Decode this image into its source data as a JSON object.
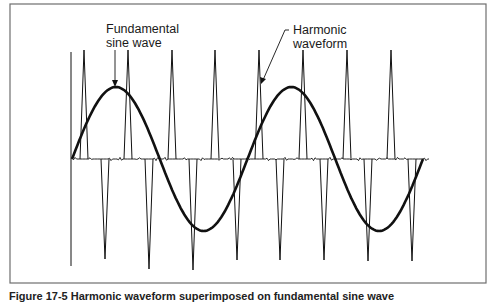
{
  "figure": {
    "labels": {
      "fundamental_line1": "Fundamental",
      "fundamental_line2": "sine wave",
      "harmonic_line1": "Harmonic",
      "harmonic_line2": "waveform"
    },
    "caption": "Figure 17-5  Harmonic waveform superimposed on fundamental sine wave"
  },
  "colors": {
    "frame": "#6e6e6e",
    "stroke": "#111111",
    "background": "#ffffff"
  },
  "geometry": {
    "frame": {
      "x": 10,
      "y": 4,
      "w": 476,
      "h": 279
    },
    "baseline": {
      "y": 159,
      "x_start": 72,
      "x_end": 430
    },
    "left_marker": {
      "x": 71,
      "y_top": 52,
      "y_bottom": 266
    },
    "up_spikes_x": [
      84,
      128,
      172,
      215,
      259,
      303,
      347,
      391
    ],
    "up_spike_top_y": 50,
    "down_spikes_x": [
      105,
      149,
      193,
      237,
      280,
      324,
      368,
      412
    ],
    "down_spike_bottom_y": [
      259,
      269,
      270,
      260,
      260,
      260,
      261,
      261
    ],
    "sine": {
      "x_start": 72,
      "x_end": 423,
      "center_y": 159,
      "amplitude": 72,
      "cycles": 2
    }
  }
}
